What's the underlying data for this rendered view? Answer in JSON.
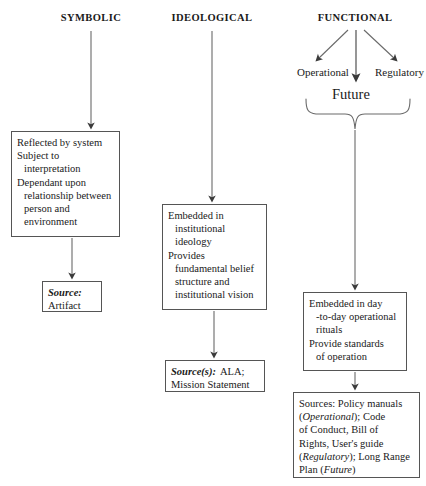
{
  "diagram": {
    "columns": [
      {
        "id": "symbolic",
        "heading": "SYMBOLIC",
        "description_lines": [
          "Reflected by system",
          "Subject to",
          "interpretation",
          "Dependant upon",
          "relationship between",
          "person and",
          "environment"
        ],
        "source_label": "Source:",
        "source_value": "Artifact"
      },
      {
        "id": "ideological",
        "heading": "IDEOLOGICAL",
        "description_lines": [
          "Embedded in",
          "institutional",
          "ideology",
          "Provides",
          "fundamental belief",
          "structure and",
          "institutional vision"
        ],
        "source_label": "Source(s):",
        "source_value_line1": "ALA;",
        "source_value_line2": "Mission Statement"
      },
      {
        "id": "functional",
        "heading": "FUNCTIONAL",
        "branches": [
          "Operational",
          "Future",
          "Regulatory"
        ],
        "description_lines": [
          "Embedded in day",
          "-to-day operational",
          "rituals",
          "Provide standards",
          "of operation"
        ],
        "sources_line1_a": "Sources: Policy manuals",
        "sources_line2_a": "(",
        "sources_line2_i": "Operational",
        "sources_line2_b": "); Code",
        "sources_line3": "of Conduct, Bill of",
        "sources_line4": "Rights, User's guide",
        "sources_line5_a": "(",
        "sources_line5_i": "Regulatory",
        "sources_line5_b": "); Long Range",
        "sources_line6_a": "Plan (",
        "sources_line6_i": "Future",
        "sources_line6_b": ")"
      }
    ],
    "colors": {
      "line": "#555555",
      "text": "#1a1a1a",
      "background": "#ffffff"
    }
  }
}
